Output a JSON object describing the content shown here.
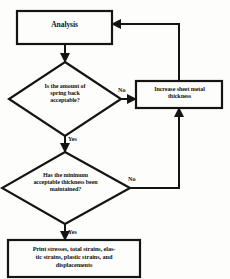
{
  "diagram": {
    "type": "flowchart",
    "ink_color": "#141414",
    "paper_color": "#fdfdfb",
    "nodes": {
      "analysis": {
        "shape": "process",
        "label": "Analysis"
      },
      "springback_decision": {
        "shape": "decision",
        "line1": "Is the amount of",
        "line2": "spring back",
        "line3": "acceptable?"
      },
      "increase_thickness": {
        "shape": "process",
        "line1": "Increase sheet metal",
        "line2": "thickness"
      },
      "thickness_decision": {
        "shape": "decision",
        "line1": "Has the minimum",
        "line2": "acceptable thickness been",
        "line3": "maintained?"
      },
      "print_results": {
        "shape": "process",
        "line1": "Print stresses, total strains, elas-",
        "line2": "tic strains, plastic strains, and",
        "line3": "displacements"
      }
    },
    "edge_labels": {
      "springback_no": "No",
      "springback_yes": "Yes",
      "thickness_no": "No",
      "thickness_yes": "Yes"
    }
  }
}
